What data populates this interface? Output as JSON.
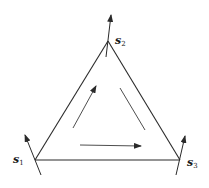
{
  "diagram": {
    "type": "triangle-circulation",
    "stroke_color": "#2a2a2a",
    "vertices": [
      {
        "id": "s1",
        "label": "s",
        "subscript": "1",
        "x": 35,
        "y": 160
      },
      {
        "id": "s2",
        "label": "s",
        "subscript": "2",
        "x": 108,
        "y": 41
      },
      {
        "id": "s3",
        "label": "s",
        "subscript": "3",
        "x": 180,
        "y": 160
      }
    ],
    "edges": [
      {
        "from": "s1",
        "to": "s2"
      },
      {
        "from": "s2",
        "to": "s3"
      },
      {
        "from": "s1",
        "to": "s3"
      }
    ],
    "vertex_arrows": [
      {
        "at": "s1",
        "direction": "up-left"
      },
      {
        "at": "s2",
        "direction": "up"
      },
      {
        "at": "s3",
        "direction": "up-right"
      }
    ],
    "inner_arrows": [
      {
        "position": "left",
        "direction": "up-right",
        "head": true
      },
      {
        "position": "right",
        "direction": "down-right",
        "head": false
      },
      {
        "position": "bottom",
        "direction": "right",
        "head": true
      }
    ]
  }
}
